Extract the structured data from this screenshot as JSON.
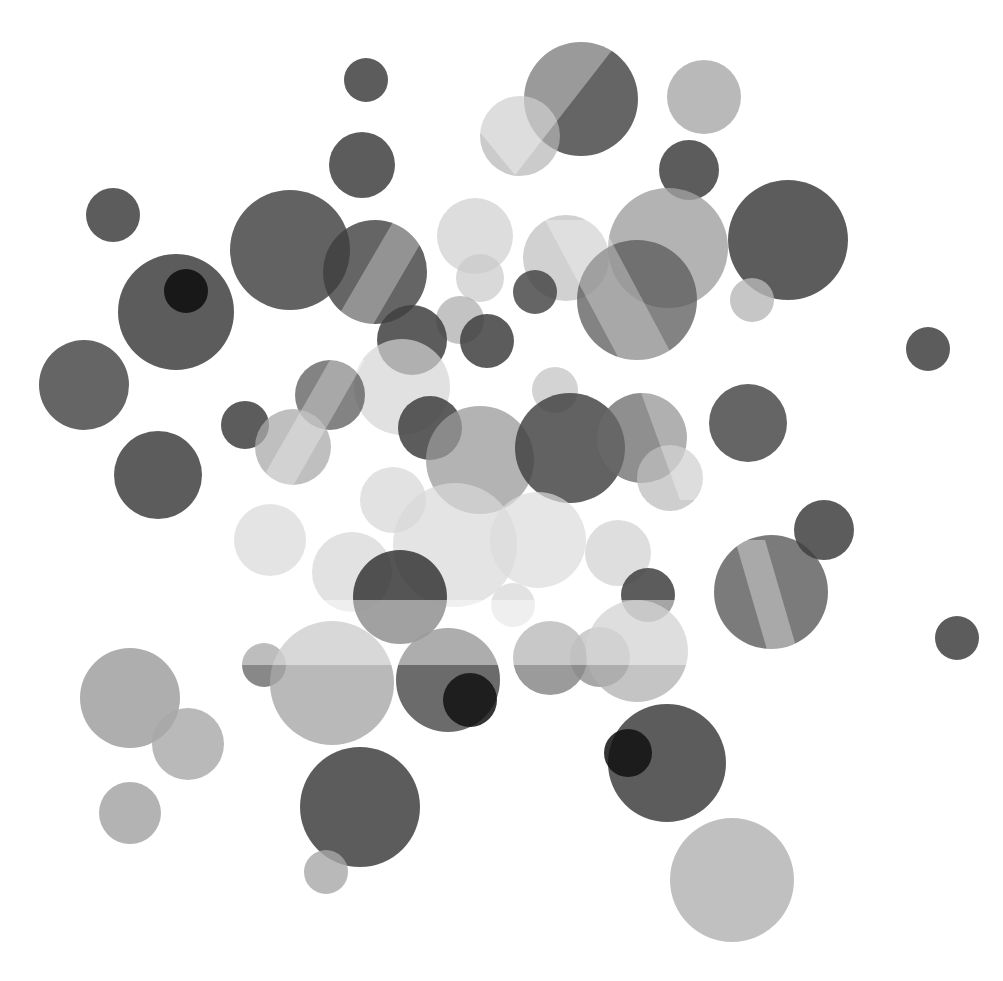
{
  "canvas": {
    "width": 1003,
    "height": 981,
    "background": "#ffffff"
  },
  "palette": {
    "dark": "#3f3f3f",
    "mid": "#8a8a8a",
    "light": "#c9c9c9",
    "black": "#111111"
  },
  "circles": [
    {
      "cx": 581,
      "cy": 99,
      "r": 57,
      "fill": "#4a4a4a",
      "o": 0.85
    },
    {
      "cx": 520,
      "cy": 136,
      "r": 40,
      "fill": "#b5b5b5",
      "o": 0.7
    },
    {
      "cx": 704,
      "cy": 97,
      "r": 37,
      "fill": "#a8a8a8",
      "o": 0.8
    },
    {
      "cx": 366,
      "cy": 80,
      "r": 22,
      "fill": "#3f3f3f",
      "o": 0.85
    },
    {
      "cx": 362,
      "cy": 165,
      "r": 33,
      "fill": "#3f3f3f",
      "o": 0.85
    },
    {
      "cx": 689,
      "cy": 170,
      "r": 30,
      "fill": "#3f3f3f",
      "o": 0.85
    },
    {
      "cx": 113,
      "cy": 215,
      "r": 27,
      "fill": "#3f3f3f",
      "o": 0.85
    },
    {
      "cx": 290,
      "cy": 250,
      "r": 60,
      "fill": "#3f3f3f",
      "o": 0.82
    },
    {
      "cx": 375,
      "cy": 272,
      "r": 52,
      "fill": "#3f3f3f",
      "o": 0.8
    },
    {
      "cx": 475,
      "cy": 236,
      "r": 38,
      "fill": "#cfcfcf",
      "o": 0.7
    },
    {
      "cx": 480,
      "cy": 278,
      "r": 24,
      "fill": "#c9c9c9",
      "o": 0.7
    },
    {
      "cx": 566,
      "cy": 258,
      "r": 43,
      "fill": "#bdbdbd",
      "o": 0.7
    },
    {
      "cx": 668,
      "cy": 248,
      "r": 60,
      "fill": "#a0a0a0",
      "o": 0.8
    },
    {
      "cx": 637,
      "cy": 300,
      "r": 60,
      "fill": "#5a5a5a",
      "o": 0.75
    },
    {
      "cx": 788,
      "cy": 240,
      "r": 60,
      "fill": "#3f3f3f",
      "o": 0.85
    },
    {
      "cx": 752,
      "cy": 300,
      "r": 22,
      "fill": "#b8b8b8",
      "o": 0.8
    },
    {
      "cx": 176,
      "cy": 312,
      "r": 58,
      "fill": "#3f3f3f",
      "o": 0.85
    },
    {
      "cx": 186,
      "cy": 291,
      "r": 22,
      "fill": "#111111",
      "o": 0.9
    },
    {
      "cx": 535,
      "cy": 292,
      "r": 22,
      "fill": "#3f3f3f",
      "o": 0.8
    },
    {
      "cx": 460,
      "cy": 320,
      "r": 24,
      "fill": "#a9a9a9",
      "o": 0.7
    },
    {
      "cx": 412,
      "cy": 340,
      "r": 35,
      "fill": "#3f3f3f",
      "o": 0.85
    },
    {
      "cx": 487,
      "cy": 341,
      "r": 27,
      "fill": "#3f3f3f",
      "o": 0.85
    },
    {
      "cx": 928,
      "cy": 349,
      "r": 22,
      "fill": "#3f3f3f",
      "o": 0.85
    },
    {
      "cx": 84,
      "cy": 385,
      "r": 45,
      "fill": "#4a4a4a",
      "o": 0.85
    },
    {
      "cx": 402,
      "cy": 387,
      "r": 48,
      "fill": "#d4d4d4",
      "o": 0.7
    },
    {
      "cx": 330,
      "cy": 395,
      "r": 35,
      "fill": "#5a5a5a",
      "o": 0.75
    },
    {
      "cx": 245,
      "cy": 425,
      "r": 24,
      "fill": "#3f3f3f",
      "o": 0.85
    },
    {
      "cx": 293,
      "cy": 447,
      "r": 38,
      "fill": "#aaaaaa",
      "o": 0.75
    },
    {
      "cx": 430,
      "cy": 428,
      "r": 32,
      "fill": "#3f3f3f",
      "o": 0.85
    },
    {
      "cx": 480,
      "cy": 460,
      "r": 54,
      "fill": "#9a9a9a",
      "o": 0.75
    },
    {
      "cx": 555,
      "cy": 390,
      "r": 23,
      "fill": "#c0c0c0",
      "o": 0.7
    },
    {
      "cx": 570,
      "cy": 448,
      "r": 55,
      "fill": "#3f3f3f",
      "o": 0.82
    },
    {
      "cx": 642,
      "cy": 438,
      "r": 45,
      "fill": "#6a6a6a",
      "o": 0.75
    },
    {
      "cx": 748,
      "cy": 423,
      "r": 39,
      "fill": "#4a4a4a",
      "o": 0.85
    },
    {
      "cx": 670,
      "cy": 478,
      "r": 33,
      "fill": "#bdbdbd",
      "o": 0.75
    },
    {
      "cx": 158,
      "cy": 475,
      "r": 44,
      "fill": "#3f3f3f",
      "o": 0.85
    },
    {
      "cx": 393,
      "cy": 500,
      "r": 33,
      "fill": "#d6d6d6",
      "o": 0.7
    },
    {
      "cx": 455,
      "cy": 545,
      "r": 62,
      "fill": "#d8d8d8",
      "o": 0.7
    },
    {
      "cx": 538,
      "cy": 540,
      "r": 48,
      "fill": "#dcdcdc",
      "o": 0.7
    },
    {
      "cx": 618,
      "cy": 553,
      "r": 33,
      "fill": "#d0d0d0",
      "o": 0.7
    },
    {
      "cx": 270,
      "cy": 540,
      "r": 36,
      "fill": "#d8d8d8",
      "o": 0.7
    },
    {
      "cx": 352,
      "cy": 572,
      "r": 40,
      "fill": "#d6d6d6",
      "o": 0.7
    },
    {
      "cx": 400,
      "cy": 597,
      "r": 47,
      "fill": "#2f2f2f",
      "o": 0.82
    },
    {
      "cx": 648,
      "cy": 595,
      "r": 27,
      "fill": "#3f3f3f",
      "o": 0.85
    },
    {
      "cx": 513,
      "cy": 605,
      "r": 22,
      "fill": "#d6d6d6",
      "o": 0.7
    },
    {
      "cx": 771,
      "cy": 592,
      "r": 57,
      "fill": "#5a5a5a",
      "o": 0.8
    },
    {
      "cx": 824,
      "cy": 530,
      "r": 30,
      "fill": "#3f3f3f",
      "o": 0.85
    },
    {
      "cx": 957,
      "cy": 638,
      "r": 22,
      "fill": "#3f3f3f",
      "o": 0.85
    },
    {
      "cx": 264,
      "cy": 665,
      "r": 22,
      "fill": "#6a6a6a",
      "o": 0.8
    },
    {
      "cx": 332,
      "cy": 683,
      "r": 62,
      "fill": "#a8a8a8",
      "o": 0.8
    },
    {
      "cx": 448,
      "cy": 680,
      "r": 52,
      "fill": "#4a4a4a",
      "o": 0.82
    },
    {
      "cx": 470,
      "cy": 700,
      "r": 27,
      "fill": "#111111",
      "o": 0.85
    },
    {
      "cx": 550,
      "cy": 658,
      "r": 37,
      "fill": "#7a7a7a",
      "o": 0.75
    },
    {
      "cx": 600,
      "cy": 657,
      "r": 30,
      "fill": "#8a8a8a",
      "o": 0.75
    },
    {
      "cx": 637,
      "cy": 651,
      "r": 51,
      "fill": "#b0b0b0",
      "o": 0.75
    },
    {
      "cx": 130,
      "cy": 698,
      "r": 50,
      "fill": "#9a9a9a",
      "o": 0.8
    },
    {
      "cx": 188,
      "cy": 744,
      "r": 36,
      "fill": "#a8a8a8",
      "o": 0.8
    },
    {
      "cx": 667,
      "cy": 763,
      "r": 59,
      "fill": "#3f3f3f",
      "o": 0.85
    },
    {
      "cx": 628,
      "cy": 753,
      "r": 24,
      "fill": "#111111",
      "o": 0.85
    },
    {
      "cx": 130,
      "cy": 813,
      "r": 31,
      "fill": "#a0a0a0",
      "o": 0.8
    },
    {
      "cx": 360,
      "cy": 807,
      "r": 60,
      "fill": "#3f3f3f",
      "o": 0.85
    },
    {
      "cx": 326,
      "cy": 872,
      "r": 22,
      "fill": "#a8a8a8",
      "o": 0.8
    },
    {
      "cx": 732,
      "cy": 880,
      "r": 62,
      "fill": "#b0b0b0",
      "o": 0.8
    }
  ],
  "bands": [
    {
      "type": "rect",
      "x": 240,
      "y": 600,
      "w": 450,
      "h": 65,
      "fill": "#ffffff",
      "o": 0.45
    },
    {
      "type": "poly",
      "points": "470,120 545,40 620,40 515,175",
      "fill": "#ffffff",
      "o": 0.35
    },
    {
      "type": "poly",
      "points": "545,220 600,220 680,370 625,370",
      "fill": "#ffffff",
      "o": 0.3
    },
    {
      "type": "poly",
      "points": "400,210 440,210 370,330 330,330",
      "fill": "#ffffff",
      "o": 0.3
    },
    {
      "type": "poly",
      "points": "330,360 365,360 285,500 250,500",
      "fill": "#ffffff",
      "o": 0.3
    },
    {
      "type": "poly",
      "points": "640,390 680,390 720,500 680,500",
      "fill": "#ffffff",
      "o": 0.3
    },
    {
      "type": "poly",
      "points": "735,540 765,540 800,660 770,660",
      "fill": "#ffffff",
      "o": 0.35
    }
  ]
}
